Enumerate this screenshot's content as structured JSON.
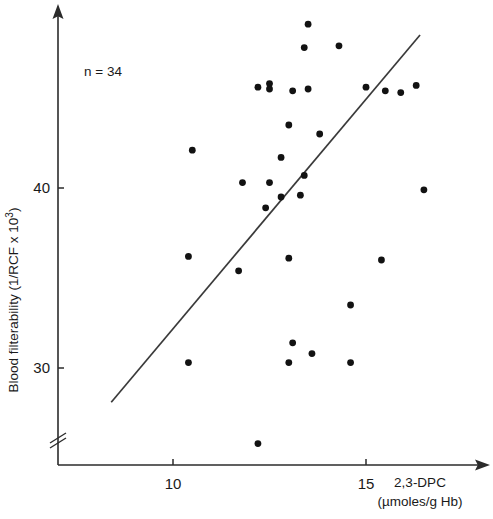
{
  "chart_data": {
    "type": "scatter",
    "title": "",
    "xlabel": "2,3-DPC",
    "xlabel_units": "(µmoles/g Hb)",
    "ylabel_prefix": "Blood filterability (1/RCF x 10",
    "ylabel_exponent": "3",
    "ylabel_suffix": ")",
    "ylabel_full": "Blood filterability (1/RCF x 10³)",
    "annotation": "n = 34",
    "n": 34,
    "xticks": [
      10,
      15
    ],
    "xtick_labels": [
      "10",
      "15"
    ],
    "yticks": [
      30,
      40
    ],
    "ytick_labels": [
      "30",
      "40"
    ],
    "xlim": [
      7.7,
      17.5
    ],
    "ylim": [
      25.3,
      48.2
    ],
    "grid": false,
    "legend": false,
    "y_axis_break": true,
    "point_color": "#121212",
    "line_color": "#3a3a3a",
    "axis_color": "#2b2b2b",
    "regression_line": {
      "x_start": 8.4,
      "y_start": 28.1,
      "x_end": 16.4,
      "y_end": 48.5
    },
    "x": [
      11.8,
      12.5,
      13.5,
      13.4,
      14.3,
      12.2,
      12.5,
      13.1,
      13.5,
      15.0,
      15.5,
      15.9,
      16.3,
      10.5,
      13.0,
      13.8,
      12.8,
      12.5,
      12.8,
      12.4,
      13.3,
      13.4,
      16.5,
      10.4,
      11.7,
      13.0,
      15.4,
      14.6,
      10.4,
      13.1,
      13.6,
      13.0,
      14.6,
      12.2
    ],
    "y": [
      40.3,
      45.5,
      49.1,
      47.8,
      47.9,
      45.6,
      45.8,
      45.4,
      45.5,
      45.6,
      45.4,
      45.3,
      45.7,
      42.1,
      43.5,
      43.0,
      41.7,
      40.3,
      39.5,
      38.9,
      39.6,
      40.7,
      39.9,
      36.2,
      35.4,
      36.1,
      36.0,
      33.5,
      30.3,
      31.4,
      30.8,
      30.3,
      30.3,
      25.8
    ],
    "points": [
      {
        "x": 11.8,
        "y": 40.3
      },
      {
        "x": 12.5,
        "y": 45.5
      },
      {
        "x": 13.5,
        "y": 49.1
      },
      {
        "x": 13.4,
        "y": 47.8
      },
      {
        "x": 14.3,
        "y": 47.9
      },
      {
        "x": 12.2,
        "y": 45.6
      },
      {
        "x": 12.5,
        "y": 45.8
      },
      {
        "x": 13.1,
        "y": 45.4
      },
      {
        "x": 13.5,
        "y": 45.5
      },
      {
        "x": 15.0,
        "y": 45.6
      },
      {
        "x": 15.5,
        "y": 45.4
      },
      {
        "x": 15.9,
        "y": 45.3
      },
      {
        "x": 16.3,
        "y": 45.7
      },
      {
        "x": 10.5,
        "y": 42.1
      },
      {
        "x": 13.0,
        "y": 43.5
      },
      {
        "x": 13.8,
        "y": 43.0
      },
      {
        "x": 12.8,
        "y": 41.7
      },
      {
        "x": 12.5,
        "y": 40.3
      },
      {
        "x": 12.8,
        "y": 39.5
      },
      {
        "x": 12.4,
        "y": 38.9
      },
      {
        "x": 13.3,
        "y": 39.6
      },
      {
        "x": 13.4,
        "y": 40.7
      },
      {
        "x": 16.5,
        "y": 39.9
      },
      {
        "x": 10.4,
        "y": 36.2
      },
      {
        "x": 11.7,
        "y": 35.4
      },
      {
        "x": 13.0,
        "y": 36.1
      },
      {
        "x": 15.4,
        "y": 36.0
      },
      {
        "x": 14.6,
        "y": 33.5
      },
      {
        "x": 10.4,
        "y": 30.3
      },
      {
        "x": 13.1,
        "y": 31.4
      },
      {
        "x": 13.6,
        "y": 30.8
      },
      {
        "x": 13.0,
        "y": 30.3
      },
      {
        "x": 14.6,
        "y": 30.3
      },
      {
        "x": 12.2,
        "y": 25.8
      }
    ]
  }
}
